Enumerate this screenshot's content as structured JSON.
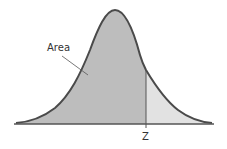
{
  "diagram": {
    "labels": {
      "area": "Area",
      "z": "Z"
    },
    "colors": {
      "curve": "#4a4a4a",
      "shaded_area": "#bdbdbd",
      "tail_area": "#e2e2e2",
      "axis": "#555555"
    }
  }
}
